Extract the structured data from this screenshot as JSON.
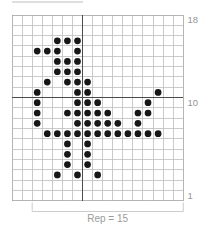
{
  "chart_data": {
    "type": "heatmap",
    "columns": 17,
    "rows": 18,
    "cell_symbol": "dot",
    "filled_cells_by_row": {
      "3": [
        5,
        7,
        9
      ],
      "4": [
        6,
        8
      ],
      "5": [
        6,
        8
      ],
      "6": [
        6,
        8
      ],
      "7": [
        4,
        5,
        6,
        7,
        8,
        9,
        10,
        11,
        12,
        13,
        14,
        15
      ],
      "8": [
        3,
        7,
        8,
        9,
        10,
        11,
        13
      ],
      "9": [
        3,
        6,
        7,
        8,
        9,
        10,
        13,
        14
      ],
      "10": [
        3,
        7,
        8,
        9,
        14
      ],
      "11": [
        3,
        7,
        8,
        15
      ],
      "12": [
        4,
        6,
        7,
        8
      ],
      "13": [
        5,
        6,
        7
      ],
      "14": [
        5,
        6,
        7
      ],
      "15": [
        3,
        4,
        5,
        7
      ],
      "16": [
        5,
        6,
        7
      ]
    },
    "row_axis_labels": [
      {
        "row": 18,
        "text": "18"
      },
      {
        "row": 10,
        "text": "10"
      },
      {
        "row": 1,
        "text": "1"
      }
    ],
    "bold_lines": {
      "vertical_after_column": 7,
      "horizontal_above_row": 10
    },
    "repeat_bracket": {
      "text": "Rep = 15",
      "from_column": 3,
      "to_column": 17,
      "stitches": 15
    },
    "colors": {
      "dot": "#161616",
      "grid_line": "#bdbdbd",
      "grid_border": "#a3a3a3",
      "bold_line": "#4c4c4c",
      "axis_label": "#969696",
      "bracket": "#cccccc",
      "repeat_label": "#9b9b9b"
    }
  }
}
